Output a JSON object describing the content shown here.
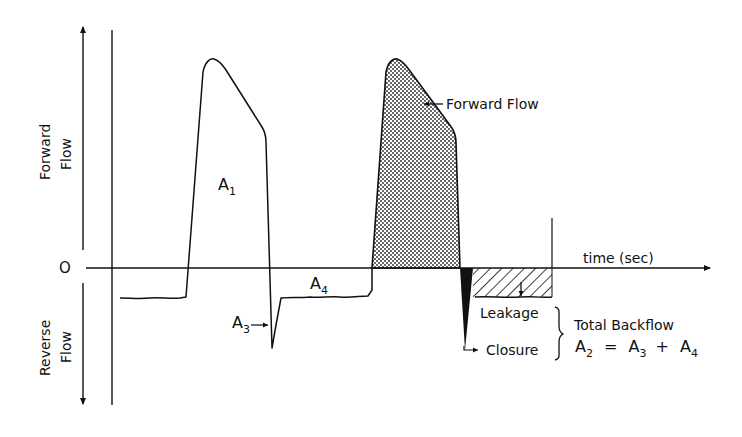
{
  "diagram": {
    "type": "flow-waveform",
    "y_axis": {
      "forward_label_line1": "Forward",
      "forward_label_line2": "Flow",
      "reverse_label_line1": "Reverse",
      "reverse_label_line2": "Flow",
      "zero_label": "O"
    },
    "x_axis": {
      "label": "time (sec)"
    },
    "areas": {
      "a1": {
        "letter": "A",
        "sub": "1"
      },
      "a3": {
        "letter": "A",
        "sub": "3"
      },
      "a4": {
        "letter": "A",
        "sub": "4"
      }
    },
    "annotations": {
      "forward_flow": "Forward Flow",
      "leakage": "Leakage",
      "closure": "Closure",
      "total_backflow": "Total Backflow",
      "formula": {
        "lhs_letter": "A",
        "lhs_sub": "2",
        "eq": "=",
        "t1_letter": "A",
        "t1_sub": "3",
        "plus": "+",
        "t2_letter": "A",
        "t2_sub": "4"
      }
    },
    "colors": {
      "ink": "#111111",
      "background": "#ffffff"
    }
  }
}
